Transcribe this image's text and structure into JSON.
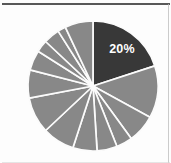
{
  "figure": {
    "kind": "pie-chart-figure",
    "background_color": "#fdfdfd",
    "rule_color": "#4a4a4a"
  },
  "chart_data": {
    "type": "pie",
    "title": "",
    "xlabel": "",
    "ylabel": "",
    "legend": "none",
    "grid": false,
    "start_angle_deg": 90,
    "direction": "clockwise",
    "center_px": [
      93,
      86
    ],
    "radius_px": 65,
    "highlight_color": "#383838",
    "slice_color": "#888888",
    "separator_color": "#fbfbfb",
    "labels": [
      "20%"
    ],
    "categories": [
      "Segment 1",
      "Segment 2",
      "Segment 3",
      "Segment 4",
      "Segment 5",
      "Segment 6",
      "Segment 7",
      "Segment 8",
      "Segment 9",
      "Segment 10",
      "Segment 11",
      "Segment 12",
      "Segment 13",
      "Segment 14"
    ],
    "values": [
      20,
      13,
      7,
      4,
      5,
      6,
      8,
      9,
      7,
      5,
      3,
      4,
      2,
      7
    ],
    "slices": [
      {
        "label": "20%",
        "value": 20,
        "color": "#383838",
        "highlighted": true,
        "data_label": "20%"
      },
      {
        "label": "",
        "value": 13,
        "color": "#888888",
        "highlighted": false,
        "data_label": ""
      },
      {
        "label": "",
        "value": 7,
        "color": "#888888",
        "highlighted": false,
        "data_label": ""
      },
      {
        "label": "",
        "value": 4,
        "color": "#888888",
        "highlighted": false,
        "data_label": ""
      },
      {
        "label": "",
        "value": 5,
        "color": "#888888",
        "highlighted": false,
        "data_label": ""
      },
      {
        "label": "",
        "value": 6,
        "color": "#888888",
        "highlighted": false,
        "data_label": ""
      },
      {
        "label": "",
        "value": 8,
        "color": "#888888",
        "highlighted": false,
        "data_label": ""
      },
      {
        "label": "",
        "value": 9,
        "color": "#888888",
        "highlighted": false,
        "data_label": ""
      },
      {
        "label": "",
        "value": 7,
        "color": "#888888",
        "highlighted": false,
        "data_label": ""
      },
      {
        "label": "",
        "value": 5,
        "color": "#888888",
        "highlighted": false,
        "data_label": ""
      },
      {
        "label": "",
        "value": 3,
        "color": "#888888",
        "highlighted": false,
        "data_label": ""
      },
      {
        "label": "",
        "value": 4,
        "color": "#888888",
        "highlighted": false,
        "data_label": ""
      },
      {
        "label": "",
        "value": 2,
        "color": "#888888",
        "highlighted": false,
        "data_label": ""
      },
      {
        "label": "",
        "value": 7,
        "color": "#888888",
        "highlighted": false,
        "data_label": ""
      }
    ],
    "label_position_px": [
      122,
      53
    ]
  }
}
